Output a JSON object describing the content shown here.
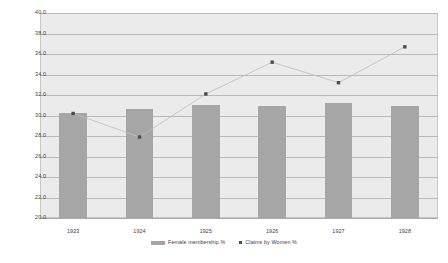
{
  "chart_data": {
    "type": "bar",
    "title": "",
    "xlabel": "",
    "ylabel": "",
    "categories": [
      "1923",
      "1924",
      "1925",
      "1926",
      "1927",
      "1928"
    ],
    "ylim": [
      20.0,
      40.0
    ],
    "ytick_labels": [
      "20.0",
      "22.0",
      "24.0",
      "26.0",
      "28.0",
      "30.0",
      "32.0",
      "34.0",
      "36.0",
      "38.0",
      "40.0"
    ],
    "ytick_values": [
      20.0,
      22.0,
      24.0,
      26.0,
      28.0,
      30.0,
      32.0,
      34.0,
      36.0,
      38.0,
      40.0
    ],
    "grid": true,
    "legend_position": "bottom",
    "series": [
      {
        "name": "Female membership %",
        "type": "bar",
        "color": "#a6a6a6",
        "values": [
          30.2,
          30.6,
          31.0,
          30.9,
          31.2,
          30.9
        ]
      },
      {
        "name": "Claims by Women %",
        "type": "line",
        "color": "#4d4d4d",
        "marker": "square-dot",
        "values": [
          30.2,
          27.9,
          32.1,
          35.2,
          33.2,
          36.7
        ]
      }
    ]
  },
  "legend": {
    "entries": [
      {
        "label": "Female membership %",
        "swatch": "bar-swatch",
        "color": "#a6a6a6"
      },
      {
        "label": "Claims by Women %",
        "swatch": "dot-marker",
        "color": "#4d4d4d"
      }
    ]
  }
}
